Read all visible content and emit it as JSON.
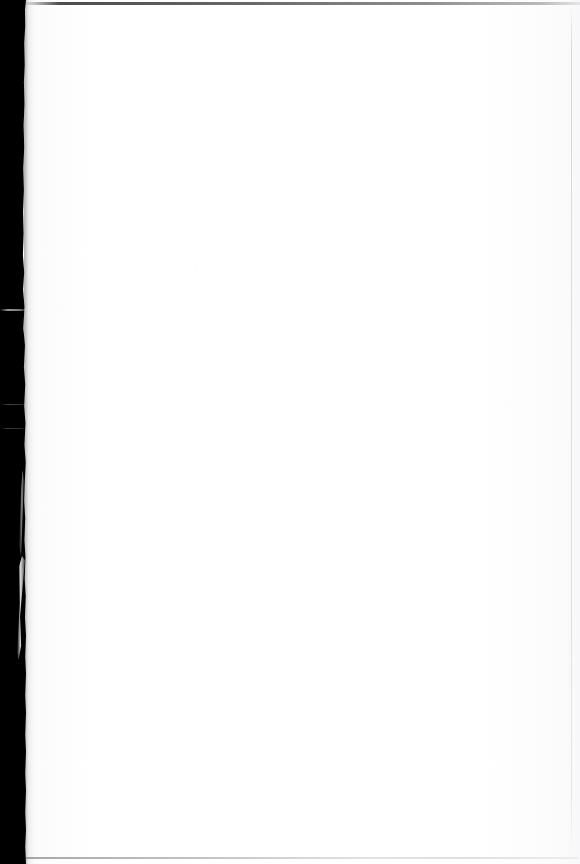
{
  "document": {
    "kind": "scanned-page",
    "page_label": "",
    "body_text": "",
    "is_blank": "true",
    "width_px": 580,
    "height_px": 864
  },
  "colors": {
    "paper": "#fefefe",
    "gutter": "#000000",
    "top_rule": "#202024",
    "bottom_rule": "#787880",
    "edge_line": "#bababf"
  },
  "regions": {
    "gutter_label": "",
    "paper_label": "",
    "top_rule_label": "",
    "bottom_rule_label": "",
    "edge_line_label": ""
  },
  "speckles": [
    {
      "x": 196,
      "y": 268,
      "size": 2,
      "opacity": 0.3
    },
    {
      "x": 236,
      "y": 287,
      "size": 2,
      "opacity": 0.26
    },
    {
      "x": 61,
      "y": 308,
      "size": 2,
      "opacity": 0.22
    },
    {
      "x": 571,
      "y": 121,
      "size": 2,
      "opacity": 0.24
    },
    {
      "x": 572,
      "y": 272,
      "size": 2,
      "opacity": 0.2
    },
    {
      "x": 505,
      "y": 405,
      "size": 2,
      "opacity": 0.22
    },
    {
      "x": 460,
      "y": 475,
      "size": 2,
      "opacity": 0.2
    },
    {
      "x": 428,
      "y": 523,
      "size": 2,
      "opacity": 0.18
    },
    {
      "x": 325,
      "y": 554,
      "size": 2,
      "opacity": 0.18
    },
    {
      "x": 427,
      "y": 569,
      "size": 2,
      "opacity": 0.18
    },
    {
      "x": 483,
      "y": 372,
      "size": 2,
      "opacity": 0.2
    },
    {
      "x": 545,
      "y": 704,
      "size": 2,
      "opacity": 0.18
    }
  ]
}
